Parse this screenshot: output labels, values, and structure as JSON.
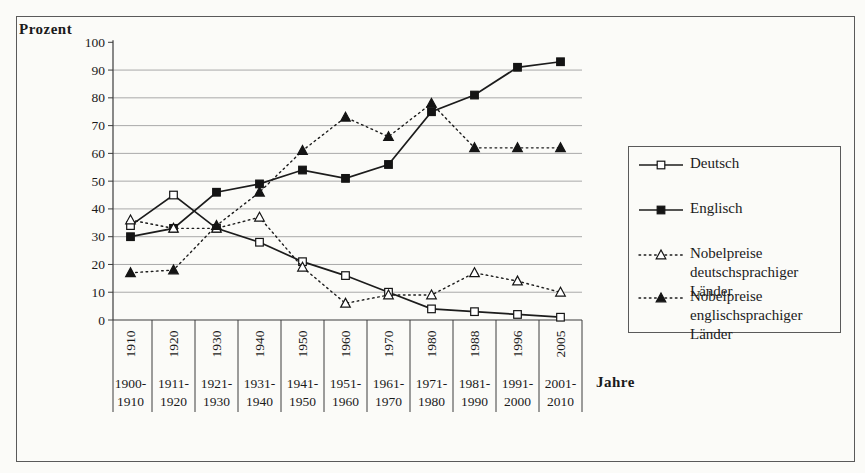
{
  "chart_data": {
    "type": "line",
    "title": "",
    "ylabel": "Prozent",
    "xlabel": "Jahre",
    "ylim": [
      0,
      100
    ],
    "y_ticks": [
      0,
      10,
      20,
      30,
      40,
      50,
      60,
      70,
      80,
      90,
      100
    ],
    "grid": true,
    "legend_position": "right",
    "categories": [
      "1910",
      "1920",
      "1930",
      "1940",
      "1950",
      "1960",
      "1970",
      "1980",
      "1988",
      "1996",
      "2005"
    ],
    "category_ranges": [
      "1900-1910",
      "1911-1920",
      "1921-1930",
      "1931-1940",
      "1941-1950",
      "1951-1960",
      "1961-1970",
      "1971-1980",
      "1981-1990",
      "1991-2000",
      "2001-2010"
    ],
    "series": [
      {
        "name": "Deutsch",
        "legend_label": "Deutsch",
        "line": "solid",
        "marker": "open-square",
        "values": [
          34,
          45,
          33,
          28,
          21,
          16,
          10,
          4,
          3,
          2,
          1
        ]
      },
      {
        "name": "Englisch",
        "legend_label": "Englisch",
        "line": "solid",
        "marker": "filled-square",
        "values": [
          30,
          33,
          46,
          49,
          54,
          51,
          56,
          75,
          81,
          91,
          93
        ]
      },
      {
        "name": "Nobelpreise deutschsprachiger Länder",
        "legend_label": "Nobelpreise\ndeutschsprachiger Länder",
        "line": "dotted",
        "marker": "open-triangle",
        "values": [
          36,
          33,
          33,
          37,
          19,
          6,
          9,
          9,
          17,
          14,
          10
        ]
      },
      {
        "name": "Nobelpreise englischsprachiger Länder",
        "legend_label": "Nobelpreise\nenglischsprachiger Länder",
        "line": "dotted",
        "marker": "filled-triangle",
        "values": [
          17,
          18,
          34,
          46,
          61,
          73,
          66,
          78,
          62,
          62,
          62
        ]
      }
    ],
    "colors": {
      "line": "#1c1c1c",
      "grid": "#a9a9a9",
      "axis": "#3c3c3c",
      "text": "#1a1a1a",
      "background": "#fbfbf8"
    }
  }
}
